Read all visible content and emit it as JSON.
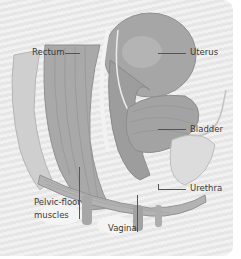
{
  "diagram": {
    "labels": {
      "rectum": "Rectum",
      "uterus": "Uterus",
      "bladder": "Bladder",
      "urethra": "Urethra",
      "pelvic_floor_line1": "Pelvic-floor",
      "pelvic_floor_line2": "muscles",
      "vagina": "Vagina"
    },
    "colors": {
      "background_stripe_light": "#f1f1f1",
      "background_stripe_dark": "#e6e6e6",
      "organ_mid": "#a8a8a8",
      "organ_dark": "#8f8f8f",
      "organ_light": "#c4c4c4",
      "label_text": "#3a3a3a",
      "leader_line": "#555555"
    }
  }
}
